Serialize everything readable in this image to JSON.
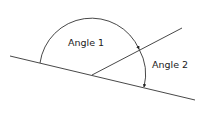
{
  "diagram": {
    "labels": {
      "angle1": "Angle 1",
      "angle2": "Angle 2"
    },
    "line_color": "#333333",
    "elements": [
      {
        "type": "line",
        "name": "base-line",
        "from": [
          10,
          56
        ],
        "to": [
          195,
          100
        ]
      },
      {
        "type": "ray",
        "name": "inclined-ray",
        "from": [
          92,
          75
        ],
        "to": [
          182,
          28
        ]
      },
      {
        "type": "arc",
        "name": "angle-1-arc",
        "from": [
          40,
          63
        ],
        "to": [
          139,
          48
        ],
        "arrow_end": true
      },
      {
        "type": "arc",
        "name": "angle-2-arc",
        "from": [
          139,
          48
        ],
        "to": [
          144,
          88
        ],
        "arrow_end": true
      }
    ]
  }
}
